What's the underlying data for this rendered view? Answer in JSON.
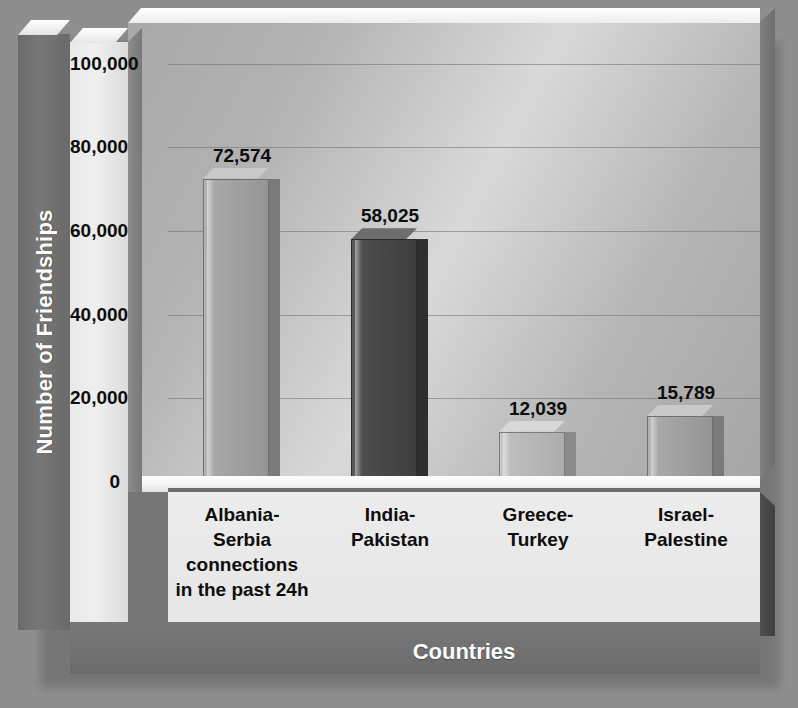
{
  "chart_data": {
    "type": "bar",
    "title": "",
    "xlabel": "Countries",
    "ylabel": "Number of Friendships",
    "categories": [
      "Albania-\nSerbia\nconnections\nin the past 24h",
      "India-\nPakistan",
      "Greece-\nTurkey",
      "Israel-\nPalestine"
    ],
    "category_lines": [
      [
        "Albania-",
        "Serbia",
        "connections",
        "in the past 24h"
      ],
      [
        "India-",
        "Pakistan"
      ],
      [
        "Greece-",
        "Turkey"
      ],
      [
        "Israel-",
        "Palestine"
      ]
    ],
    "values": [
      72574,
      58025,
      12039,
      15789
    ],
    "value_labels": [
      "72,574",
      "58,025",
      "12,039",
      "15,789"
    ],
    "ylim": [
      0,
      110000
    ],
    "yticks": [
      0,
      20000,
      40000,
      60000,
      80000,
      100000
    ],
    "ytick_labels": [
      "0",
      "20,000",
      "40,000",
      "60,000",
      "80,000",
      "100,000"
    ],
    "grid": true,
    "legend": false,
    "style": "3d-bar",
    "bar_colors": [
      "#a2a2a2",
      "#464646",
      "#bdbdbd",
      "#b0b0b0"
    ]
  },
  "colors": {
    "page_background": "#8e8e8e",
    "plot_background": "#c2c2c2",
    "axis_label_band": "#727272",
    "axis_label_text": "#fdfdfd",
    "tick_text": "#0d0d0d",
    "gridline": "#6e6e6e"
  }
}
